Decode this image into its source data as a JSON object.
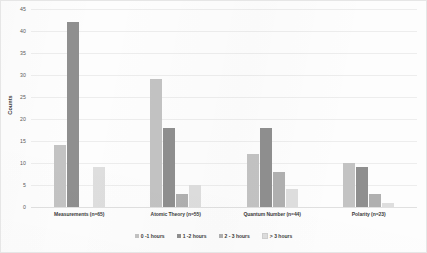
{
  "chart_data": {
    "type": "bar",
    "title": "",
    "xlabel": "",
    "ylabel": "Counts",
    "ylim": [
      0,
      45
    ],
    "ytick_step": 5,
    "yticks": [
      "0",
      "5",
      "10",
      "15",
      "20",
      "25",
      "30",
      "35",
      "40",
      "45"
    ],
    "grid": true,
    "legend_position": "bottom-center",
    "categories": [
      "Measurements (n=65)",
      "Atomic Theory (n=55)",
      "Quantum Number (n=44)",
      "Polarity (n=23)"
    ],
    "series": [
      {
        "name": "0 -1 hours",
        "color": "#c3c3c3",
        "values": [
          14,
          29,
          12,
          10
        ]
      },
      {
        "name": "1 -2 hours",
        "color": "#8f8f8f",
        "values": [
          42,
          18,
          18,
          9
        ]
      },
      {
        "name": "2 - 3 hours",
        "color": "#b0b0b0",
        "values": [
          0,
          3,
          8,
          3
        ]
      },
      {
        "name": "> 3 hours",
        "color": "#dedede",
        "values": [
          9,
          5,
          4,
          1
        ]
      }
    ]
  }
}
